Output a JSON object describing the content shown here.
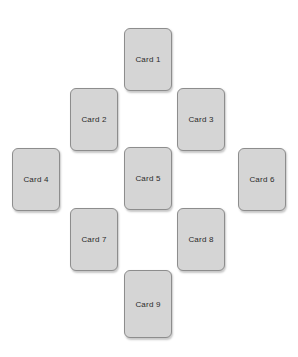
{
  "page": {
    "width": 298,
    "height": 357,
    "background_color": "#ffffff",
    "header_clipped_text": "··· ··· ······ ·· ·· ····"
  },
  "spread": {
    "layout_name": "diamond-cross-spread",
    "card_count": 9,
    "card_style": {
      "fill_color": "#d5d5d5",
      "border_color": "#8d8d8d",
      "label_color": "#2b2b2b",
      "width": 48,
      "height": 63,
      "corner_radius": 6
    },
    "cards": [
      {
        "label": "Card 1",
        "x": 124,
        "y": 28,
        "w": 48,
        "h": 63
      },
      {
        "label": "Card 2",
        "x": 70,
        "y": 88,
        "w": 48,
        "h": 63
      },
      {
        "label": "Card 3",
        "x": 177,
        "y": 88,
        "w": 48,
        "h": 63
      },
      {
        "label": "Card 4",
        "x": 12,
        "y": 148,
        "w": 48,
        "h": 63
      },
      {
        "label": "Card 5",
        "x": 124,
        "y": 147,
        "w": 48,
        "h": 63
      },
      {
        "label": "Card 6",
        "x": 238,
        "y": 148,
        "w": 48,
        "h": 63
      },
      {
        "label": "Card 7",
        "x": 70,
        "y": 208,
        "w": 48,
        "h": 63
      },
      {
        "label": "Card 8",
        "x": 177,
        "y": 208,
        "w": 48,
        "h": 63
      },
      {
        "label": "Card 9",
        "x": 124,
        "y": 270,
        "w": 48,
        "h": 68
      }
    ]
  }
}
